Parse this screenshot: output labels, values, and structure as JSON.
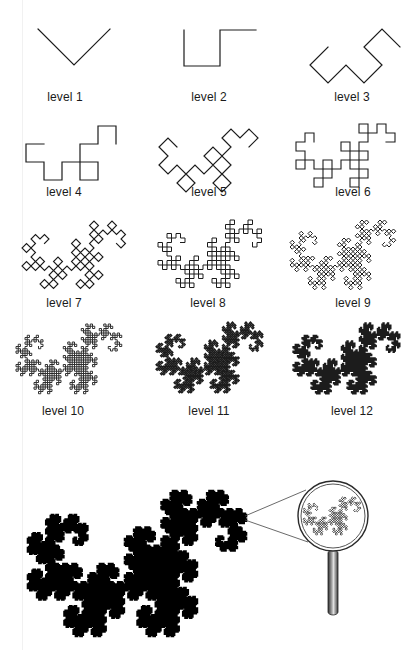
{
  "figure": {
    "colors": {
      "line": "#1c1c1c",
      "fill": "#000000",
      "lens_ring": "#333333",
      "handle_dark": "#3a3a3a",
      "handle_light": "#d8d8d8"
    },
    "chord_length": 72,
    "levels": [
      {
        "level": 1,
        "label": "level 1",
        "left": 38,
        "top": 29,
        "label_x": 65,
        "label_y": 90,
        "stroke": 1.2
      },
      {
        "level": 2,
        "label": "level 2",
        "left": 184,
        "top": 30,
        "label_x": 209,
        "label_y": 90,
        "stroke": 1.2
      },
      {
        "level": 3,
        "label": "level 3",
        "left": 310,
        "top": 29,
        "label_x": 352,
        "label_y": 90,
        "stroke": 1.2
      },
      {
        "level": 4,
        "label": "level 4",
        "left": 26,
        "top": 126,
        "label_x": 64,
        "label_y": 185,
        "stroke": 1.2
      },
      {
        "level": 5,
        "label": "level 5",
        "left": 159,
        "top": 129,
        "label_x": 209,
        "label_y": 185,
        "stroke": 1.2
      },
      {
        "level": 6,
        "label": "level 6",
        "left": 296,
        "top": 124,
        "label_x": 353,
        "label_y": 185,
        "stroke": 1.1
      },
      {
        "level": 7,
        "label": "level 7",
        "left": 22,
        "top": 221,
        "label_x": 64,
        "label_y": 296,
        "stroke": 1.1
      },
      {
        "level": 8,
        "label": "level 8",
        "left": 158,
        "top": 220,
        "label_x": 208,
        "label_y": 296,
        "stroke": 1.0
      },
      {
        "level": 9,
        "label": "level 9",
        "left": 290,
        "top": 220,
        "label_x": 353,
        "label_y": 296,
        "stroke": 1.0
      },
      {
        "level": 10,
        "label": "level 10",
        "left": 16,
        "top": 324,
        "label_x": 63,
        "label_y": 404,
        "stroke": 0.9
      },
      {
        "level": 11,
        "label": "level 11",
        "left": 156,
        "top": 322,
        "label_x": 209,
        "label_y": 404,
        "stroke": 1.3
      },
      {
        "level": 12,
        "label": "level 12",
        "left": 293,
        "top": 323,
        "label_x": 352,
        "label_y": 404,
        "stroke": 1.3
      }
    ],
    "big_dragon": {
      "level": 14,
      "left": 28,
      "top": 491,
      "width": 218,
      "stroke": 2.6
    },
    "magnifier": {
      "cx": 333,
      "cy": 516,
      "r_outer": 35,
      "r_inner": 32,
      "handle": {
        "x": 328,
        "y": 550,
        "w": 10,
        "h": 65
      },
      "rays": [
        {
          "x1": 245,
          "y1": 516,
          "x2": 306,
          "y2": 490
        },
        {
          "x1": 245,
          "y1": 520,
          "x2": 308,
          "y2": 542
        }
      ],
      "inner_dragon": {
        "level": 9,
        "left": 303,
        "top": 497,
        "width": 58,
        "stroke": 0.8
      }
    }
  }
}
